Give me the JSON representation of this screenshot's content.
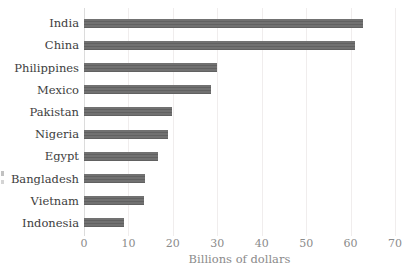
{
  "chart_data": {
    "type": "bar",
    "orientation": "horizontal",
    "categories": [
      "India",
      "China",
      "Philippines",
      "Mexico",
      "Pakistan",
      "Nigeria",
      "Egypt",
      "Bangladesh",
      "Vietnam",
      "Indonesia"
    ],
    "values": [
      62.7,
      61.0,
      29.9,
      28.5,
      19.8,
      19.0,
      16.6,
      13.7,
      13.4,
      8.9
    ],
    "title": "",
    "xlabel": "Billions of dollars",
    "ylabel": "",
    "xlim": [
      0,
      70
    ],
    "xticks": [
      0,
      10,
      20,
      30,
      40,
      50,
      60,
      70
    ],
    "xtick_labels": [
      "0",
      "10",
      "20",
      "30",
      "40",
      "50",
      "60",
      "70"
    ],
    "grid": "vertical",
    "legend": "none",
    "colors": {
      "bar": "#6e6e6e",
      "bar_stripe": "#616161",
      "category_label": "#3d3d3d",
      "tick_label": "#8b8b8b",
      "axis_title": "#8b8b8b",
      "gridline": "#f0eded",
      "zero_line": "#dcdcdc",
      "background": "#ffffff"
    }
  }
}
